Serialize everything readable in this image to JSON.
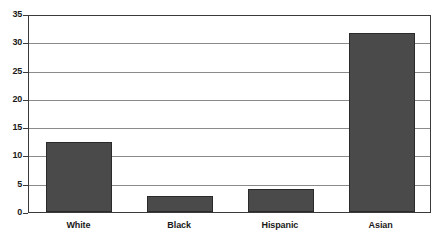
{
  "chart_data": {
    "type": "bar",
    "title": "",
    "subtitle": "",
    "xlabel": "",
    "ylabel": "",
    "categories": [
      "White",
      "Black",
      "Hispanic",
      "Asian"
    ],
    "values": [
      12.4,
      2.9,
      4.0,
      31.7
    ],
    "series": [
      {
        "name": "",
        "values": [
          12.4,
          2.9,
          4.0,
          31.7
        ]
      }
    ],
    "ylim": [
      0,
      35
    ],
    "yticks": [
      0,
      5,
      10,
      15,
      20,
      25,
      30,
      35
    ],
    "ytick_labels": [
      "0",
      "5",
      "10",
      "15",
      "20",
      "25",
      "30",
      "35"
    ],
    "grid": true,
    "grid_axis": "y",
    "legend": false,
    "legend_position": "none",
    "annotations": [],
    "colors": {
      "bar_fill": "#4a4a4a",
      "bar_border": "#2a2a2a",
      "gridline": "#8a8a8a",
      "axis_border": "#3a3a3a",
      "plot_background": "#ffffff",
      "figure_background": "#ffffff",
      "tick_label": "#1a1a1a"
    }
  }
}
